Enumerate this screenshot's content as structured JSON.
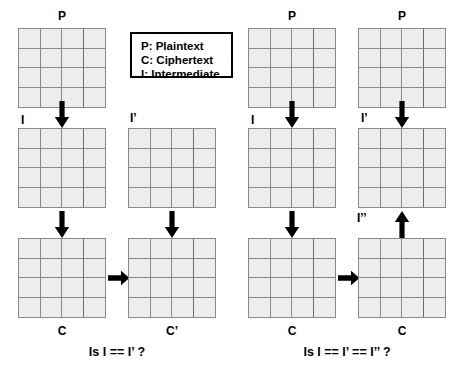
{
  "diagram": {
    "background_color": "#ffffff",
    "grid_fill_color": "#ededed",
    "grid_border_color": "#8a8a8a",
    "arrow_color": "#000000"
  },
  "legend": {
    "lines": [
      "P: Plaintext",
      "C: Ciphertext",
      "I: Intermediate"
    ]
  },
  "left_panel": {
    "caption": "Is I == I’ ?",
    "labels": {
      "p": "P",
      "i": "I",
      "i_prime": "I’",
      "c": "C",
      "c_prime": "C’"
    }
  },
  "right_panel": {
    "caption": "Is I == I’ == I’’ ?",
    "labels": {
      "p_left": "P",
      "p_right": "P",
      "i": "I",
      "i_prime": "I’",
      "i_double_prime": "I’’",
      "c_left": "C",
      "c_right": "C"
    }
  },
  "grid_spec": {
    "rows": 4,
    "columns": 4
  }
}
